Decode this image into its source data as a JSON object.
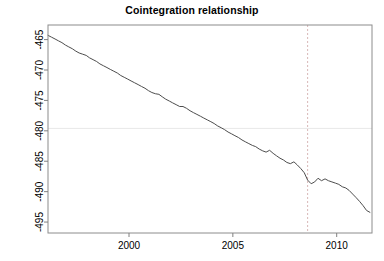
{
  "chart_data": {
    "type": "line",
    "title": "Cointegration relationship",
    "xlabel": "",
    "ylabel": "",
    "xlim": [
      1996.1,
      2011.7
    ],
    "ylim": [
      -496.8,
      -462.6
    ],
    "xticks": [
      2000,
      2005,
      2010
    ],
    "xtick_labels": [
      "2000",
      "2005",
      "2010"
    ],
    "yticks": [
      -495,
      -490,
      -485,
      -480,
      -475,
      -470,
      -465
    ],
    "ytick_labels": [
      "-495",
      "-490",
      "-485",
      "-480",
      "-475",
      "-470",
      "-465"
    ],
    "grid": false,
    "legend": null,
    "series": [
      {
        "name": "cointegration residual",
        "color": "#4d4d4d",
        "x": [
          1996.1,
          1996.27,
          1996.44,
          1996.6,
          1996.77,
          1996.94,
          1997.1,
          1997.27,
          1997.44,
          1997.6,
          1997.77,
          1997.94,
          1998.1,
          1998.27,
          1998.44,
          1998.6,
          1998.77,
          1998.94,
          1999.1,
          1999.27,
          1999.44,
          1999.6,
          1999.77,
          1999.94,
          2000.1,
          2000.27,
          2000.44,
          2000.6,
          2000.77,
          2000.94,
          2001.1,
          2001.27,
          2001.44,
          2001.6,
          2001.77,
          2001.94,
          2002.1,
          2002.27,
          2002.44,
          2002.6,
          2002.77,
          2002.94,
          2003.1,
          2003.27,
          2003.44,
          2003.6,
          2003.77,
          2003.94,
          2004.1,
          2004.27,
          2004.44,
          2004.6,
          2004.77,
          2004.94,
          2005.1,
          2005.27,
          2005.44,
          2005.6,
          2005.77,
          2005.94,
          2006.1,
          2006.27,
          2006.44,
          2006.6,
          2006.77,
          2006.94,
          2007.1,
          2007.27,
          2007.44,
          2007.6,
          2007.77,
          2007.94,
          2008.1,
          2008.27,
          2008.44,
          2008.6,
          2008.77,
          2008.94,
          2009.1,
          2009.27,
          2009.44,
          2009.6,
          2009.77,
          2009.94,
          2010.1,
          2010.27,
          2010.44,
          2010.6,
          2010.77,
          2010.94,
          2011.1,
          2011.27,
          2011.44,
          2011.6
        ],
        "y": [
          -464.3,
          -464.6,
          -464.9,
          -465.2,
          -465.5,
          -465.9,
          -466.2,
          -466.5,
          -466.9,
          -467.2,
          -467.4,
          -467.6,
          -468.0,
          -468.3,
          -468.6,
          -469.0,
          -469.3,
          -469.6,
          -469.9,
          -470.2,
          -470.5,
          -470.9,
          -471.2,
          -471.5,
          -471.8,
          -472.1,
          -472.4,
          -472.7,
          -473.0,
          -473.4,
          -473.7,
          -473.9,
          -474.0,
          -474.4,
          -474.8,
          -475.1,
          -475.4,
          -475.7,
          -476.0,
          -476.0,
          -476.3,
          -476.7,
          -477.0,
          -477.3,
          -477.6,
          -477.9,
          -478.2,
          -478.5,
          -478.8,
          -479.2,
          -479.5,
          -479.8,
          -480.2,
          -480.5,
          -480.8,
          -481.1,
          -481.5,
          -481.8,
          -482.1,
          -482.4,
          -482.6,
          -483.0,
          -483.3,
          -483.5,
          -483.2,
          -483.7,
          -484.1,
          -484.5,
          -484.8,
          -485.2,
          -485.4,
          -485.1,
          -485.6,
          -486.2,
          -486.9,
          -488.1,
          -488.7,
          -488.4,
          -487.8,
          -488.2,
          -487.9,
          -488.2,
          -488.4,
          -488.6,
          -488.8,
          -489.2,
          -489.4,
          -489.8,
          -490.4,
          -491.0,
          -491.6,
          -492.3,
          -493.1,
          -493.4
        ]
      }
    ],
    "reference_lines": [
      {
        "name": "horizontal-mean-line",
        "orientation": "horizontal",
        "value": -479.6,
        "color": "#e8e8e8",
        "style": "solid"
      },
      {
        "name": "vertical-event-line",
        "orientation": "vertical",
        "value": 2008.6,
        "color": "#d8b8b8",
        "style": "dashed"
      }
    ]
  },
  "axes": {
    "frame_color": "#808080",
    "tick_color": "#808080",
    "label_color": "#000000"
  }
}
